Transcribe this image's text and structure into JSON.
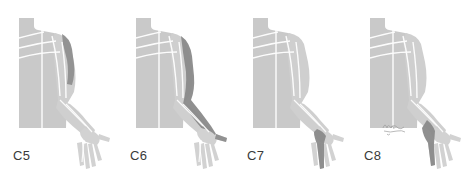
{
  "figure": {
    "background_color": "#ffffff",
    "body_fill_color": "#c9c9c9",
    "body_light_color": "#d5d5d5",
    "highlight_color": "#8c8c8c",
    "outline_color": "#ffffff",
    "label_color": "#3a3a3a",
    "signature_color": "#9a9a9a"
  },
  "panels": [
    {
      "label": "C5",
      "dermatome": "C5",
      "highlight_region": "lateral shoulder and deltoid",
      "x": 0
    },
    {
      "label": "C6",
      "dermatome": "C6",
      "highlight_region": "lateral arm, lateral forearm and thumb",
      "x": 117
    },
    {
      "label": "C7",
      "dermatome": "C7",
      "highlight_region": "middle finger",
      "x": 234
    },
    {
      "label": "C8",
      "dermatome": "C8",
      "highlight_region": "medial hand and little finger",
      "x": 351
    }
  ],
  "signature": {
    "present": true,
    "panel": "C8",
    "text": ""
  }
}
